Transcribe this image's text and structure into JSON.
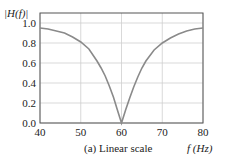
{
  "chart_data": {
    "type": "line",
    "title": "",
    "caption": "(a) Linear scale",
    "xlabel": "f (Hz)",
    "ylabel": "|H(f)|",
    "xlim": [
      40,
      80
    ],
    "ylim": [
      0,
      1.1
    ],
    "grid": true,
    "x_ticks": [
      40,
      50,
      60,
      70,
      80
    ],
    "x_tick_labels": [
      "40",
      "50",
      "60",
      "70",
      "80"
    ],
    "y_ticks": [
      0.0,
      0.2,
      0.4,
      0.6,
      0.8,
      1.0
    ],
    "y_tick_labels": [
      "0.0",
      "0.2",
      "0.4",
      "0.6",
      "0.8",
      "1.0"
    ],
    "series": [
      {
        "name": "|H(f)|",
        "color": "#8a8a8a",
        "x": [
          40,
          42,
          44,
          46,
          48,
          50,
          52,
          54,
          55,
          56,
          57,
          58,
          59,
          60,
          61,
          62,
          63,
          64,
          65,
          66,
          68,
          70,
          72,
          74,
          76,
          78,
          80
        ],
        "values": [
          0.95,
          0.94,
          0.92,
          0.9,
          0.86,
          0.81,
          0.74,
          0.62,
          0.55,
          0.47,
          0.37,
          0.26,
          0.13,
          0.0,
          0.13,
          0.25,
          0.36,
          0.46,
          0.55,
          0.62,
          0.73,
          0.8,
          0.85,
          0.89,
          0.92,
          0.94,
          0.95
        ]
      }
    ]
  },
  "labels": {
    "ylabel": "|H(f)|",
    "xlabel": "f (Hz)",
    "caption": "(a) Linear scale"
  }
}
